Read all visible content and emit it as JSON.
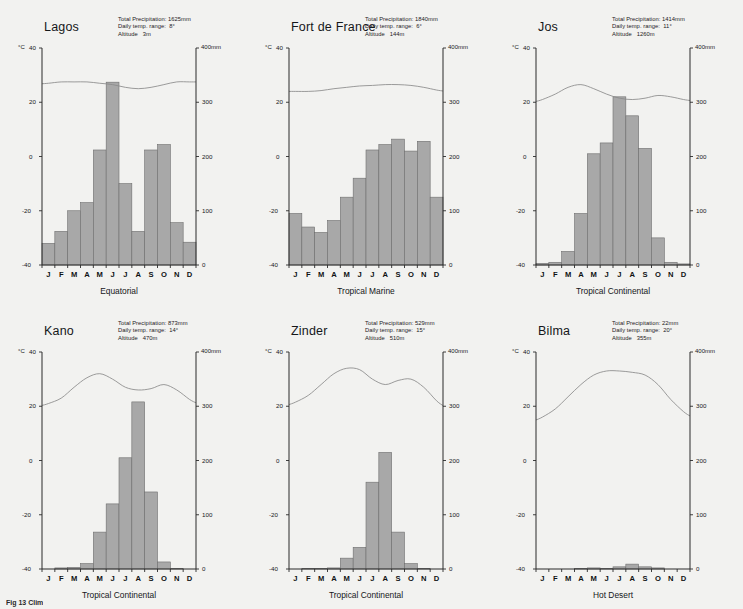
{
  "figure": {
    "caption_partial": "Fig 13  Clim",
    "axis": {
      "temp_unit_label": "°C",
      "precip_unit_label": "400mm",
      "temp_ticks": [
        40,
        20,
        0,
        -20,
        -40
      ],
      "precip_ticks": [
        400,
        300,
        200,
        100,
        0
      ],
      "temp_min": -40,
      "temp_max": 40,
      "precip_min": 0,
      "precip_max": 400,
      "months": [
        "J",
        "F",
        "M",
        "A",
        "M",
        "J",
        "J",
        "A",
        "S",
        "O",
        "N",
        "D"
      ]
    },
    "labels": {
      "total_precipitation": "Total Precipitation:",
      "daily_temp_range": "Daily temp. range:",
      "altitude": "Altitude"
    },
    "colors": {
      "panel_background": "#f2f2f0",
      "bar_fill": "#a8a8a8",
      "bar_stroke": "#6e6e6e",
      "axis": "#2b2b2b",
      "temp_line": "#8a8a8a"
    }
  },
  "chart_data": [
    {
      "type": "bar",
      "title": "Lagos",
      "climate_type": "Equatorial",
      "total_precipitation": "1625mm",
      "daily_temp_range": "8°",
      "altitude": "3m",
      "categories": [
        "J",
        "F",
        "M",
        "A",
        "M",
        "J",
        "J",
        "A",
        "S",
        "O",
        "N",
        "D"
      ],
      "series": [
        {
          "name": "Precipitation (mm)",
          "values": [
            40,
            62,
            100,
            115,
            212,
            337,
            150,
            62,
            212,
            222,
            78,
            42
          ]
        },
        {
          "name": "Temperature (°C)",
          "values": [
            27,
            27.5,
            27.5,
            27.5,
            27,
            26.5,
            25.5,
            25,
            25.5,
            26.5,
            27.5,
            27.5
          ]
        }
      ],
      "xlabel": "",
      "ylabel": "Temperature (°C)",
      "y2label": "Precipitation (mm)",
      "ylim": [
        -40,
        40
      ],
      "y2lim": [
        0,
        400
      ],
      "grid": false
    },
    {
      "type": "bar",
      "title": "Fort de France",
      "climate_type": "Tropical Marine",
      "total_precipitation": "1840mm",
      "daily_temp_range": "6°",
      "altitude": "144m",
      "categories": [
        "J",
        "F",
        "M",
        "A",
        "M",
        "J",
        "J",
        "A",
        "S",
        "O",
        "N",
        "D"
      ],
      "series": [
        {
          "name": "Precipitation (mm)",
          "values": [
            95,
            70,
            60,
            82,
            125,
            160,
            212,
            222,
            232,
            210,
            228,
            125
          ]
        },
        {
          "name": "Temperature (°C)",
          "values": [
            24,
            24,
            24.3,
            25,
            25.5,
            26,
            26.2,
            26.5,
            26.5,
            26.2,
            25.5,
            24.5
          ]
        }
      ],
      "xlabel": "",
      "ylabel": "Temperature (°C)",
      "y2label": "Precipitation (mm)",
      "ylim": [
        -40,
        40
      ],
      "y2lim": [
        0,
        400
      ],
      "grid": false
    },
    {
      "type": "bar",
      "title": "Jos",
      "climate_type": "Tropical Continental",
      "total_precipitation": "1414mm",
      "daily_temp_range": "11°",
      "altitude": "1260m",
      "categories": [
        "J",
        "F",
        "M",
        "A",
        "M",
        "J",
        "J",
        "A",
        "S",
        "O",
        "N",
        "D"
      ],
      "series": [
        {
          "name": "Precipitation (mm)",
          "values": [
            3,
            5,
            25,
            95,
            205,
            225,
            310,
            275,
            215,
            50,
            5,
            2
          ]
        },
        {
          "name": "Temperature (°C)",
          "values": [
            21,
            23,
            25.5,
            26.5,
            25,
            23,
            21.5,
            21,
            21.5,
            22.5,
            22,
            21
          ]
        }
      ],
      "xlabel": "",
      "ylabel": "Temperature (°C)",
      "y2label": "Precipitation (mm)",
      "ylim": [
        -40,
        40
      ],
      "y2lim": [
        0,
        400
      ],
      "grid": false
    },
    {
      "type": "bar",
      "title": "Kano",
      "climate_type": "Tropical Continental",
      "total_precipitation": "873mm",
      "daily_temp_range": "14°",
      "altitude": "470m",
      "categories": [
        "J",
        "F",
        "M",
        "A",
        "M",
        "J",
        "J",
        "A",
        "S",
        "O",
        "N",
        "D"
      ],
      "series": [
        {
          "name": "Precipitation (mm)",
          "values": [
            0,
            2,
            3,
            10,
            68,
            120,
            205,
            308,
            142,
            13,
            1,
            0
          ]
        },
        {
          "name": "Temperature (°C)",
          "values": [
            21,
            23,
            27,
            30.5,
            32,
            30,
            27,
            26,
            26.5,
            28,
            26,
            22.5
          ]
        }
      ],
      "xlabel": "",
      "ylabel": "Temperature (°C)",
      "y2label": "Precipitation (mm)",
      "ylim": [
        -40,
        40
      ],
      "y2lim": [
        0,
        400
      ],
      "grid": false
    },
    {
      "type": "bar",
      "title": "Zinder",
      "climate_type": "Tropical Continental",
      "total_precipitation": "529mm",
      "daily_temp_range": "15°",
      "altitude": "510m",
      "categories": [
        "J",
        "F",
        "M",
        "A",
        "M",
        "J",
        "J",
        "A",
        "S",
        "O",
        "N",
        "D"
      ],
      "series": [
        {
          "name": "Precipitation (mm)",
          "values": [
            0,
            1,
            1,
            2,
            20,
            40,
            160,
            215,
            68,
            10,
            1,
            0
          ]
        },
        {
          "name": "Temperature (°C)",
          "values": [
            21.5,
            24,
            28,
            32,
            34,
            33.5,
            30,
            28,
            29.5,
            30,
            27,
            22
          ]
        }
      ],
      "xlabel": "",
      "ylabel": "Temperature (°C)",
      "y2label": "Precipitation (mm)",
      "ylim": [
        -40,
        40
      ],
      "y2lim": [
        0,
        400
      ],
      "grid": false
    },
    {
      "type": "bar",
      "title": "Bilma",
      "climate_type": "Hot Desert",
      "total_precipitation": "22mm",
      "daily_temp_range": "20°",
      "altitude": "355m",
      "categories": [
        "J",
        "F",
        "M",
        "A",
        "M",
        "J",
        "J",
        "A",
        "S",
        "O",
        "N",
        "D"
      ],
      "series": [
        {
          "name": "Precipitation (mm)",
          "values": [
            0,
            0,
            0,
            1,
            2,
            1,
            4,
            9,
            4,
            2,
            0,
            0
          ]
        },
        {
          "name": "Temperature (°C)",
          "values": [
            16,
            19,
            23.5,
            28,
            31.5,
            33,
            33,
            32.5,
            31.5,
            28,
            22.5,
            18
          ]
        }
      ],
      "xlabel": "",
      "ylabel": "Temperature (°C)",
      "y2label": "Precipitation (mm)",
      "ylim": [
        -40,
        40
      ],
      "y2lim": [
        0,
        400
      ],
      "grid": false
    }
  ]
}
